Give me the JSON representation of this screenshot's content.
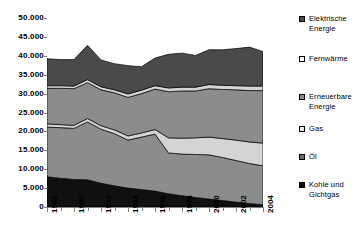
{
  "chart_data": {
    "type": "area",
    "title": "",
    "subtitle": "",
    "xlabel": "",
    "ylabel": "",
    "stacked": true,
    "grid": false,
    "legend_position": "right",
    "ylim": [
      0,
      50000
    ],
    "ytick_labels": [
      "50.000",
      "45.000",
      "40.000",
      "35.000",
      "30.000",
      "25.000",
      "20.000",
      "15.000",
      "10.000",
      "5.000",
      "0"
    ],
    "ytick_values": [
      50000,
      45000,
      40000,
      35000,
      30000,
      25000,
      20000,
      15000,
      10000,
      5000,
      0
    ],
    "x": [
      1988,
      1989,
      1990,
      1991,
      1992,
      1993,
      1994,
      1995,
      1996,
      1997,
      1998,
      1999,
      2000,
      2001,
      2002,
      2003,
      2004
    ],
    "xtick_labels": [
      "1988",
      "1990",
      "1992",
      "1994",
      "1996",
      "1998",
      "2000",
      "2002",
      "2004"
    ],
    "xtick_values": [
      1988,
      1990,
      1992,
      1994,
      1996,
      1998,
      2000,
      2002,
      2004
    ],
    "series": [
      {
        "name": "Kohle und Gichtgas",
        "color": "#101010",
        "values": [
          8000,
          7600,
          7300,
          7200,
          6300,
          5600,
          5000,
          4600,
          4200,
          3500,
          3000,
          2500,
          2100,
          1700,
          1300,
          900,
          600
        ]
      },
      {
        "name": "Öl",
        "color": "#8c8c8c",
        "values": [
          13100,
          13400,
          13500,
          15300,
          14300,
          13800,
          12700,
          13900,
          15100,
          10800,
          11000,
          11400,
          11700,
          11400,
          11000,
          10600,
          10300
        ]
      },
      {
        "name": "Gas",
        "color": "#d4d4d4",
        "values": [
          900,
          800,
          800,
          900,
          900,
          1000,
          1100,
          1100,
          1200,
          4000,
          4200,
          4400,
          4700,
          5000,
          5400,
          5700,
          6000
        ]
      },
      {
        "name": "Erneuerbare Energie",
        "color": "#8c8c8c",
        "values": [
          9400,
          9600,
          9700,
          9500,
          9500,
          9800,
          10200,
          10400,
          10700,
          12200,
          12500,
          12400,
          12800,
          13000,
          13300,
          13600,
          13900
        ]
      },
      {
        "name": "Fernwärme",
        "color": "#d4d4d4",
        "values": [
          700,
          700,
          700,
          800,
          800,
          800,
          900,
          900,
          900,
          1000,
          1000,
          1000,
          1100,
          1100,
          1100,
          1200,
          1200
        ]
      },
      {
        "name": "Elektrische Energie",
        "color": "#4a4a4a",
        "values": [
          7100,
          6900,
          7000,
          9100,
          7100,
          6900,
          7500,
          6200,
          7300,
          8900,
          9000,
          8400,
          9200,
          9400,
          9800,
          10300,
          9100
        ]
      }
    ],
    "totals": [
      39200,
      39000,
      39000,
      42800,
      38900,
      37900,
      37400,
      37100,
      39400,
      40400,
      40700,
      40100,
      41600,
      41600,
      41900,
      42300,
      41100
    ]
  },
  "legend": {
    "items": [
      {
        "label": "Elektrische\nEnergie",
        "swatch": "#4a4a4a",
        "name": "legend-elektrische-energie"
      },
      {
        "label": "Fernwärme",
        "swatch": "#ffffff",
        "name": "legend-fernwaerme"
      },
      {
        "label": "Erneuerbare\nEnergie",
        "swatch": "#8c8c8c",
        "name": "legend-erneuerbare-energie"
      },
      {
        "label": "Gas",
        "swatch": "#e8e8e8",
        "name": "legend-gas"
      },
      {
        "label": "Öl",
        "swatch": "#6e6e6e",
        "name": "legend-oel"
      },
      {
        "label": "Kohle und\nGichtgas",
        "swatch": "#101010",
        "name": "legend-kohle-und-gichtgas"
      }
    ]
  }
}
